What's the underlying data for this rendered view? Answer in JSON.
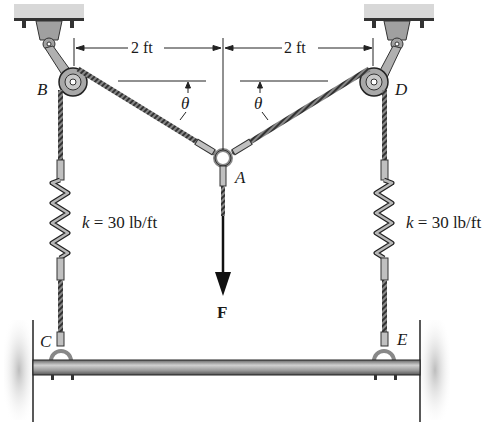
{
  "figure": {
    "points": {
      "A": "A",
      "B": "B",
      "C": "C",
      "D": "D",
      "E": "E"
    },
    "dimensions": {
      "left": "2 ft",
      "right": "2 ft"
    },
    "angles": {
      "left": "θ",
      "right": "θ"
    },
    "springs": {
      "left": {
        "label_k": "k",
        "label_rest": " = 30 lb/ft"
      },
      "right": {
        "label_k": "k",
        "label_rest": " = 30 lb/ft"
      }
    },
    "force": {
      "label": "F"
    }
  },
  "colors": {
    "metal": "#9a9a9a",
    "dark": "#1a1a1a",
    "wall_shade": "#bdbdbd"
  }
}
